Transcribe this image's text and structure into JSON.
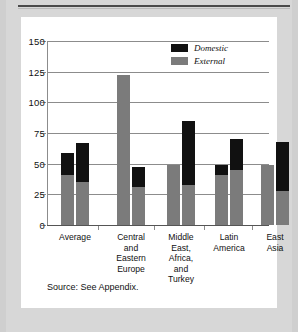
{
  "figure": {
    "source_note": "Source: See Appendix."
  },
  "legend": {
    "position": "top-right",
    "items": [
      {
        "label": "Domestic",
        "color": "#111111"
      },
      {
        "label": "External",
        "color": "#7b7b7b"
      }
    ]
  },
  "axis": {
    "y_ticks": [
      "0",
      "25",
      "50",
      "75",
      "100",
      "125",
      "150"
    ]
  },
  "chart_data": {
    "type": "bar",
    "title": "",
    "subtitle": "",
    "xlabel": "",
    "ylabel": "",
    "ylim": [
      0,
      150
    ],
    "ytick_values": [
      0,
      25,
      50,
      75,
      100,
      125,
      150
    ],
    "grid": true,
    "stacked": true,
    "legend_position": "top-right",
    "categories": [
      "Average",
      "Central\nand\nEastern\nEurope",
      "Middle\nEast,\nAfrica,\nand\nTurkey",
      "Latin\nAmerica",
      "East\nAsia"
    ],
    "series": [
      {
        "name": "External",
        "color": "#7b7b7b",
        "values_bar1": [
          41,
          122,
          49,
          41,
          49
        ],
        "values_bar2": [
          35,
          31,
          33,
          45,
          28
        ]
      },
      {
        "name": "Domestic",
        "color": "#111111",
        "values_bar1": [
          18,
          0,
          0,
          8,
          0
        ],
        "values_bar2": [
          32,
          16,
          52,
          25,
          40
        ]
      }
    ],
    "bar_totals": {
      "bar1": [
        59,
        122,
        49,
        49,
        49
      ],
      "bar2": [
        67,
        47,
        85,
        70,
        68
      ]
    },
    "bars": [
      {
        "group": "Average",
        "bar": 1,
        "external": 41,
        "domestic": 18,
        "total": 59
      },
      {
        "group": "Average",
        "bar": 2,
        "external": 35,
        "domestic": 32,
        "total": 67
      },
      {
        "group": "Central and Eastern Europe",
        "bar": 1,
        "external": 122,
        "domestic": 0,
        "total": 122
      },
      {
        "group": "Central and Eastern Europe",
        "bar": 2,
        "external": 31,
        "domestic": 16,
        "total": 47
      },
      {
        "group": "Middle East, Africa, and Turkey",
        "bar": 1,
        "external": 49,
        "domestic": 0,
        "total": 49
      },
      {
        "group": "Middle East, Africa, and Turkey",
        "bar": 2,
        "external": 33,
        "domestic": 52,
        "total": 85
      },
      {
        "group": "Latin America",
        "bar": 1,
        "external": 41,
        "domestic": 8,
        "total": 49
      },
      {
        "group": "Latin America",
        "bar": 2,
        "external": 45,
        "domestic": 25,
        "total": 70
      },
      {
        "group": "East Asia",
        "bar": 1,
        "external": 49,
        "domestic": 0,
        "total": 49
      },
      {
        "group": "East Asia",
        "bar": 2,
        "external": 28,
        "domestic": 40,
        "total": 68
      }
    ]
  }
}
